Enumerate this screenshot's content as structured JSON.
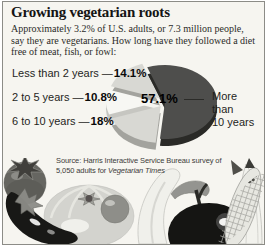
{
  "header": {
    "title": "Growing vegetarian roots",
    "subtitle": "Approximately 3.2% of U.S. adults, or 7.3 million people, say they are vegetarians. How long have they followed a diet free of meat, fish, or fowl:"
  },
  "chart_data": {
    "type": "pie",
    "title": "Growing vegetarian roots",
    "unit": "percent of U.S. vegetarians by duration of diet",
    "start_angle_deg": -20,
    "style": "3d-exploded",
    "legend_position": "left-callouts",
    "slices": [
      {
        "label": "More than 10 years",
        "value": 57.1,
        "display": "57.1%",
        "color": "#4e4e4c",
        "rim": "#2a2a27",
        "exploded": false
      },
      {
        "label": "6 to 10 years",
        "value": 18,
        "display": "18%",
        "color": "#d8d8d3",
        "rim": "#a3a39e",
        "exploded": true
      },
      {
        "label": "2 to 5 years",
        "value": 10.8,
        "display": "10.8%",
        "color": "#f7f7f3",
        "rim": "#c6c6c1",
        "exploded": true
      },
      {
        "label": "Less than 2 years",
        "value": 14.1,
        "display": "14.1%",
        "color": "#d8d8d3",
        "rim": "#a3a39e",
        "exploded": true
      }
    ]
  },
  "labels": {
    "connector": "—",
    "big_label_lines": {
      "0": "More",
      "1": "than",
      "2": "10 years"
    }
  },
  "source": {
    "line1": "Source: Harris Interactive Service Bureau survey of",
    "line2_prefix": "5,050 adults for ",
    "line2_italic": "Vegetarian Times"
  },
  "illustration": {
    "description": "grayscale still-life of vegetables across the bottom",
    "items": [
      "tomato",
      "eggplant",
      "squash",
      "small tomato",
      "white gourd",
      "leaf",
      "apple",
      "corn",
      "corn husk"
    ]
  },
  "colors": {
    "background": "#f6f5f0",
    "border": "#8c8c87",
    "title_color": "#141414"
  }
}
